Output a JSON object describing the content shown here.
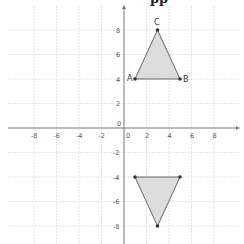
{
  "header": {
    "cropped_title_fragment": "pp"
  },
  "graph": {
    "origin_label": "0",
    "x_ticks": [
      {
        "label": "-8",
        "value": -8
      },
      {
        "label": "-6",
        "value": -6
      },
      {
        "label": "-4",
        "value": -4
      },
      {
        "label": "-2",
        "value": -2
      },
      {
        "label": "0",
        "value": 0
      },
      {
        "label": "2",
        "value": 2
      },
      {
        "label": "4",
        "value": 4
      },
      {
        "label": "6",
        "value": 6
      },
      {
        "label": "8",
        "value": 8
      }
    ],
    "y_ticks": [
      {
        "label": "8",
        "value": 8
      },
      {
        "label": "6",
        "value": 6
      },
      {
        "label": "4",
        "value": 4
      },
      {
        "label": "2",
        "value": 2
      },
      {
        "label": "-2",
        "value": -2
      },
      {
        "label": "-4",
        "value": -4
      },
      {
        "label": "-6",
        "value": -6
      },
      {
        "label": "-8",
        "value": -8
      }
    ],
    "triangle_original": {
      "vertices": [
        {
          "label": "A",
          "x": 1,
          "y": 4
        },
        {
          "label": "B",
          "x": 5,
          "y": 4
        },
        {
          "label": "C",
          "x": 3,
          "y": 8
        }
      ]
    },
    "triangle_reflected": {
      "vertices": [
        {
          "x": 1,
          "y": -4
        },
        {
          "x": 5,
          "y": -4
        },
        {
          "x": 3,
          "y": -8
        }
      ]
    },
    "colors": {
      "fill": "#dcdcdc",
      "edge": "#666666",
      "grid": "#e6e6e6",
      "axis": "#777777",
      "point": "#333333"
    }
  }
}
